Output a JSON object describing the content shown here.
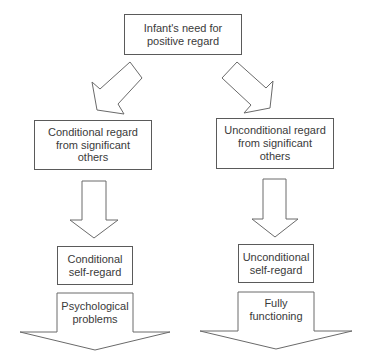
{
  "diagram": {
    "root": {
      "lines": [
        "Infant's need for",
        "positive regard"
      ]
    },
    "left_branch": {
      "regard_from_others": {
        "lines": [
          "Conditional regard",
          "from significant",
          "others"
        ]
      },
      "self_regard": {
        "lines": [
          "Conditional",
          "self-regard"
        ]
      },
      "outcome": {
        "lines": [
          "Psychological",
          "problems"
        ]
      }
    },
    "right_branch": {
      "regard_from_others": {
        "lines": [
          "Unconditional regard",
          "from significant",
          "others"
        ]
      },
      "self_regard": {
        "lines": [
          "Unconditional",
          "self-regard"
        ]
      },
      "outcome": {
        "lines": [
          "Fully",
          "functioning"
        ]
      }
    },
    "colors": {
      "background": "#ffffff",
      "stroke": "#5a5a5a",
      "text": "#3a3a3a"
    }
  }
}
